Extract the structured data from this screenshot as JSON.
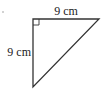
{
  "diagram": {
    "type": "right-triangle",
    "labels": {
      "top_side": "9 cm",
      "left_side": "9 cm"
    },
    "colors": {
      "stroke": "#333333",
      "text": "#222222",
      "background": "#ffffff"
    }
  }
}
